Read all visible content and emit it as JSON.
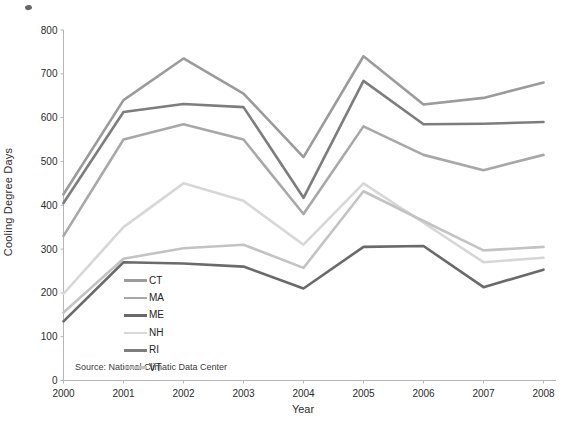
{
  "chart_data": {
    "type": "line",
    "title": "",
    "xlabel": "Year",
    "ylabel": "Cooling Degree Days",
    "x": [
      2000,
      2001,
      2002,
      2003,
      2004,
      2005,
      2006,
      2007,
      2008
    ],
    "ylim": [
      0,
      800
    ],
    "ytick_interval": 100,
    "yticks": [
      0,
      100,
      200,
      300,
      400,
      500,
      600,
      700,
      800
    ],
    "grid": false,
    "legend_position": "inside-lower-left",
    "legend_entries": [
      "CT",
      "MA",
      "ME",
      "NH",
      "RI",
      "VT"
    ],
    "series": [
      {
        "name": "CT",
        "color": "#9b9b9b",
        "values": [
          425,
          640,
          735,
          655,
          510,
          740,
          630,
          645,
          680
        ]
      },
      {
        "name": "MA",
        "color": "#a8a8a8",
        "values": [
          330,
          550,
          585,
          550,
          380,
          580,
          515,
          480,
          515
        ]
      },
      {
        "name": "ME",
        "color": "#6a6a6a",
        "values": [
          135,
          270,
          267,
          260,
          210,
          305,
          307,
          213,
          253
        ]
      },
      {
        "name": "NH",
        "color": "#d7d7d7",
        "values": [
          198,
          350,
          450,
          410,
          310,
          450,
          360,
          270,
          280
        ]
      },
      {
        "name": "RI",
        "color": "#7d7d7d",
        "values": [
          405,
          613,
          631,
          624,
          417,
          684,
          585,
          586,
          590
        ]
      },
      {
        "name": "VT",
        "color": "#c3c3c3",
        "values": [
          155,
          278,
          302,
          310,
          257,
          432,
          364,
          297,
          305
        ]
      }
    ],
    "source_note": "Source: National Climatic Data Center"
  },
  "style": {
    "axis_color": "#b6b6b6",
    "tick_label_color": "#2b2b2b"
  }
}
